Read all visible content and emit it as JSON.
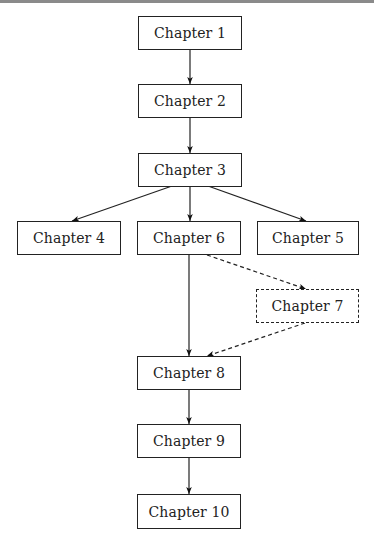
{
  "diagram": {
    "type": "flowchart",
    "nodes": [
      {
        "id": "ch1",
        "label": "Chapter 1",
        "style": "solid"
      },
      {
        "id": "ch2",
        "label": "Chapter 2",
        "style": "solid"
      },
      {
        "id": "ch3",
        "label": "Chapter 3",
        "style": "solid"
      },
      {
        "id": "ch4",
        "label": "Chapter 4",
        "style": "solid"
      },
      {
        "id": "ch6",
        "label": "Chapter 6",
        "style": "solid"
      },
      {
        "id": "ch5",
        "label": "Chapter 5",
        "style": "solid"
      },
      {
        "id": "ch7",
        "label": "Chapter 7",
        "style": "dashed"
      },
      {
        "id": "ch8",
        "label": "Chapter 8",
        "style": "solid"
      },
      {
        "id": "ch9",
        "label": "Chapter 9",
        "style": "solid"
      },
      {
        "id": "ch10",
        "label": "Chapter 10",
        "style": "solid"
      }
    ],
    "edges": [
      {
        "from": "ch1",
        "to": "ch2",
        "style": "solid"
      },
      {
        "from": "ch2",
        "to": "ch3",
        "style": "solid"
      },
      {
        "from": "ch3",
        "to": "ch4",
        "style": "solid"
      },
      {
        "from": "ch3",
        "to": "ch6",
        "style": "solid"
      },
      {
        "from": "ch3",
        "to": "ch5",
        "style": "solid"
      },
      {
        "from": "ch6",
        "to": "ch8",
        "style": "solid"
      },
      {
        "from": "ch6",
        "to": "ch7",
        "style": "dashed"
      },
      {
        "from": "ch7",
        "to": "ch8",
        "style": "dashed"
      },
      {
        "from": "ch8",
        "to": "ch9",
        "style": "solid"
      },
      {
        "from": "ch9",
        "to": "ch10",
        "style": "solid"
      }
    ]
  }
}
